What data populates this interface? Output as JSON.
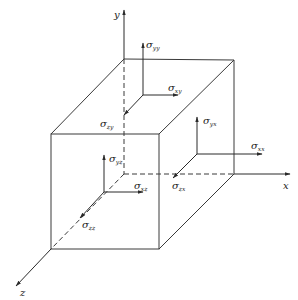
{
  "figure": {
    "axes": {
      "x": "x",
      "y": "y",
      "z": "z"
    },
    "stress_labels": [
      {
        "id": "syy",
        "symbol": "σ",
        "sub": "yy"
      },
      {
        "id": "sxy",
        "symbol": "σ",
        "sub": "xy"
      },
      {
        "id": "szy",
        "symbol": "σ",
        "sub": "zy"
      },
      {
        "id": "syx",
        "symbol": "σ",
        "sub": "yx"
      },
      {
        "id": "sxx",
        "symbol": "σ",
        "sub": "xx"
      },
      {
        "id": "syz",
        "symbol": "σ",
        "sub": "yz"
      },
      {
        "id": "sxz",
        "symbol": "σ",
        "sub": "xz"
      },
      {
        "id": "szx",
        "symbol": "σ",
        "sub": "zx"
      },
      {
        "id": "szz",
        "symbol": "σ",
        "sub": "zz"
      }
    ],
    "colors": {
      "line": "#3a3a3a",
      "text": "#222222",
      "background": "#ffffff"
    }
  }
}
